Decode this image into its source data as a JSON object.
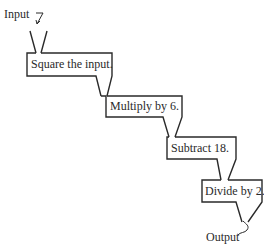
{
  "diagram": {
    "type": "function-machine-flow",
    "input_label": "Input",
    "output_label": "Output",
    "steps": [
      {
        "label": "Square the input."
      },
      {
        "label": "Multiply by 6."
      },
      {
        "label": "Subtract 18."
      },
      {
        "label": "Divide by 2."
      }
    ],
    "colors": {
      "stroke": "#2a2a2a",
      "background": "#ffffff",
      "text": "#2a2a2a"
    }
  }
}
